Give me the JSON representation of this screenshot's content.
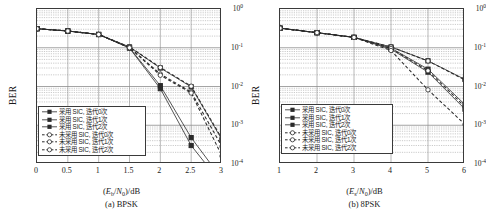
{
  "figure": {
    "panels": [
      {
        "id": "bpsk",
        "caption": "(a) BPSK",
        "xlabel_prefix": "(",
        "xlabel_E": "E",
        "xlabel_sub1": "b",
        "xlabel_slash": "/",
        "xlabel_N": "N",
        "xlabel_sub2": "0",
        "xlabel_suffix": ")/dB",
        "ylabel": "BER",
        "xticks": [
          "0",
          "0.5",
          "1",
          "1.5",
          "2",
          "2.5",
          "3"
        ],
        "yticks": [
          "0",
          "-1",
          "-2",
          "-3",
          "-4"
        ]
      },
      {
        "id": "8psk",
        "caption": "(b) 8PSK",
        "xlabel_prefix": "(",
        "xlabel_E": "E",
        "xlabel_sub1": "s",
        "xlabel_slash": "/",
        "xlabel_N": "N",
        "xlabel_sub2": "0",
        "xlabel_suffix": ")/dB",
        "ylabel": "BER",
        "xticks": [
          "1",
          "2",
          "3",
          "4",
          "5",
          "6"
        ],
        "yticks": [
          "0",
          "-1",
          "-2",
          "-3",
          "-4"
        ]
      }
    ],
    "legend_labels": [
      "采用 SIC, 迭代0次",
      "采用 SIC, 迭代1次",
      "采用 SIC, 迭代2次",
      "未采用 SIC, 迭代0次",
      "未采用 SIC, 迭代1次",
      "未采用 SIC, 迭代2次"
    ]
  },
  "chart_data": [
    {
      "type": "line",
      "title": "(a) BPSK",
      "xlabel": "(Eb/N0)/dB",
      "ylabel": "BER",
      "xlim": [
        0,
        3
      ],
      "ylim": [
        0.0001,
        1
      ],
      "yscale": "log",
      "grid": true,
      "legend_position": "lower-left",
      "x": [
        0,
        0.5,
        1,
        1.5,
        2,
        2.5,
        3
      ],
      "series": [
        {
          "name": "采用 SIC, 迭代0次",
          "marker": "filled-square",
          "line": "solid",
          "values": [
            0.31,
            0.27,
            0.22,
            0.105,
            0.03,
            0.0098,
            0.00042
          ]
        },
        {
          "name": "采用 SIC, 迭代1次",
          "marker": "filled-square",
          "line": "solid",
          "values": [
            0.31,
            0.27,
            0.22,
            0.1,
            0.0105,
            0.00048,
            4.1e-05
          ]
        },
        {
          "name": "采用 SIC, 迭代2次",
          "marker": "filled-square",
          "line": "solid",
          "values": [
            0.31,
            0.27,
            0.22,
            0.098,
            0.0088,
            0.0003,
            3e-05
          ]
        },
        {
          "name": "未采用 SIC, 迭代0次",
          "marker": "open-circle",
          "line": "dashed",
          "values": [
            0.31,
            0.27,
            0.22,
            0.105,
            0.031,
            0.0102,
            0.00045
          ]
        },
        {
          "name": "未采用 SIC, 迭代1次",
          "marker": "open-circle",
          "line": "dashed",
          "values": [
            0.31,
            0.27,
            0.22,
            0.102,
            0.021,
            0.0072,
            0.00028
          ]
        },
        {
          "name": "未采用 SIC, 迭代2次",
          "marker": "open-circle",
          "line": "dashed",
          "values": [
            0.31,
            0.27,
            0.22,
            0.1,
            0.0195,
            0.0068,
            0.00016
          ]
        }
      ]
    },
    {
      "type": "line",
      "title": "(b) 8PSK",
      "xlabel": "(Es/N0)/dB",
      "ylabel": "BER",
      "xlim": [
        1,
        6
      ],
      "ylim": [
        0.0001,
        1
      ],
      "yscale": "log",
      "grid": true,
      "legend_position": "lower-left",
      "x": [
        1,
        2,
        3,
        4,
        5,
        6
      ],
      "series": [
        {
          "name": "采用 SIC, 迭代0次",
          "marker": "filled-square",
          "line": "solid",
          "values": [
            0.32,
            0.245,
            0.185,
            0.105,
            0.046,
            0.0152
          ]
        },
        {
          "name": "采用 SIC, 迭代1次",
          "marker": "filled-square",
          "line": "solid",
          "values": [
            0.32,
            0.245,
            0.185,
            0.098,
            0.028,
            0.0034
          ]
        },
        {
          "name": "采用 SIC, 迭代2次",
          "marker": "filled-square",
          "line": "solid",
          "values": [
            0.32,
            0.245,
            0.185,
            0.092,
            0.0235,
            0.0026
          ]
        },
        {
          "name": "未采用 SIC, 迭代0次",
          "marker": "open-circle",
          "line": "dashed",
          "values": [
            0.32,
            0.245,
            0.185,
            0.105,
            0.0455,
            0.0148
          ]
        },
        {
          "name": "未采用 SIC, 迭代1次",
          "marker": "open-circle",
          "line": "dashed",
          "values": [
            0.32,
            0.245,
            0.185,
            0.096,
            0.0255,
            0.003
          ]
        },
        {
          "name": "未采用 SIC, 迭代2次",
          "marker": "open-circle",
          "line": "dashed",
          "values": [
            0.32,
            0.245,
            0.185,
            0.085,
            0.0082,
            0.00105
          ]
        }
      ]
    }
  ]
}
